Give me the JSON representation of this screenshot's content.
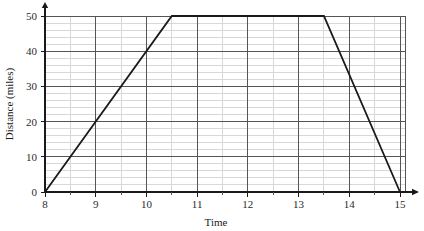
{
  "chart_data": {
    "type": "line",
    "title": "",
    "xlabel": "Time",
    "ylabel": "Distance (miles)",
    "xlim": [
      8,
      15
    ],
    "ylim": [
      0,
      50
    ],
    "x_major_ticks": [
      8,
      9,
      10,
      11,
      12,
      13,
      14,
      15
    ],
    "x_major_tick_labels": [
      "8",
      "9",
      "10",
      "11",
      "12",
      "13",
      "14",
      "15"
    ],
    "x_minor_step": 0.5,
    "y_major_ticks": [
      0,
      10,
      20,
      30,
      40,
      50
    ],
    "y_major_tick_labels": [
      "0",
      "10",
      "20",
      "30",
      "40",
      "50"
    ],
    "y_minor_step": 2,
    "grid": true,
    "grid_major_color": "#555555",
    "grid_minor_color": "#d8d8d8",
    "legend": "none",
    "axis_arrows": true,
    "series": [
      {
        "name": "Journey",
        "color": "#1a1a1a",
        "x": [
          8,
          10.5,
          13.5,
          15
        ],
        "y": [
          0,
          50,
          50,
          0
        ],
        "segments": [
          {
            "label": "outbound-travel",
            "from": [
              8,
              0
            ],
            "to": [
              10.5,
              50
            ]
          },
          {
            "label": "stationary",
            "from": [
              10.5,
              50
            ],
            "to": [
              13.5,
              50
            ]
          },
          {
            "label": "return-travel",
            "from": [
              13.5,
              50
            ],
            "to": [
              15,
              0
            ]
          }
        ]
      }
    ]
  },
  "labels": {
    "x_axis_title": "Time",
    "y_axis_title": "Distance (miles)"
  }
}
